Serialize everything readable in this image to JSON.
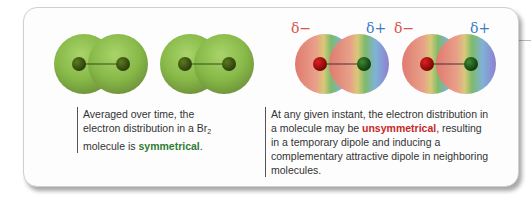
{
  "figure": {
    "left_panel": {
      "caption_part1": "Averaged over time, the electron distribution in a Br",
      "caption_sub": "2",
      "caption_part2": " molecule is ",
      "caption_highlight": "symmetrical",
      "caption_end": ".",
      "highlight_color": "#2e7d32",
      "molecules": [
        {
          "type": "symmetric",
          "surface_color": "#8cbf4a"
        },
        {
          "type": "symmetric",
          "surface_color": "#8cbf4a"
        }
      ]
    },
    "right_panel": {
      "caption_part1": "At any given instant, the electron distribution in a molecule may be ",
      "caption_highlight": "unsymmetrical",
      "caption_part2": ", resulting in a temporary dipole and inducing a complementary attractive dipole in neighboring molecules.",
      "highlight_color": "#c62828",
      "molecules": [
        {
          "type": "dipole",
          "neg_label": "δ−",
          "pos_label": "δ+"
        },
        {
          "type": "dipole",
          "neg_label": "δ−",
          "pos_label": "δ+"
        }
      ]
    },
    "colors": {
      "delta_negative": "#d9534f",
      "delta_positive": "#3b7dc4"
    }
  }
}
